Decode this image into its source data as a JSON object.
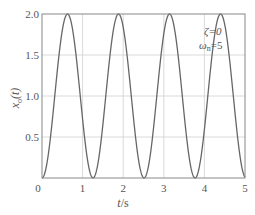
{
  "chart_data": {
    "type": "line",
    "title": "",
    "xlabel": "t/s",
    "ylabel": "x_o(t)",
    "xlim": [
      0,
      5
    ],
    "ylim": [
      0,
      2.0
    ],
    "xticks": [
      "0",
      "1",
      "2",
      "3",
      "4",
      "5"
    ],
    "yticks": [
      "0.5",
      "1.0",
      "1.5",
      "2.0"
    ],
    "grid": true,
    "annotations": [
      "ζ=0",
      "ωn=5"
    ],
    "function": "x_o(t) = 1 - cos(5t)",
    "series": [
      {
        "name": "x_o(t)",
        "color": "#666666",
        "x": [
          0,
          0.314,
          0.628,
          0.942,
          1.257,
          1.571,
          1.885,
          2.199,
          2.513,
          2.827,
          3.142,
          3.456,
          3.77,
          4.084,
          4.398,
          4.712,
          5.0
        ],
        "y": [
          0,
          1.0,
          2.0,
          1.0,
          0,
          1.0,
          2.0,
          1.0,
          0,
          1.0,
          2.0,
          1.0,
          0,
          1.0,
          2.0,
          1.0,
          0.01
        ]
      }
    ]
  },
  "labels": {
    "xlabel_t": "t",
    "xlabel_unit": "/s",
    "ylabel_x": "x",
    "ylabel_sub": "o",
    "ylabel_arg": "(t)",
    "zeta": "ζ=0",
    "omega": "ω",
    "omega_sub": "n",
    "omega_val": "=5",
    "ytick_origin": "0"
  },
  "colors": {
    "curve": "#666666",
    "frame": "#888888",
    "grid": "#d0d0d0",
    "text": "#555555"
  }
}
